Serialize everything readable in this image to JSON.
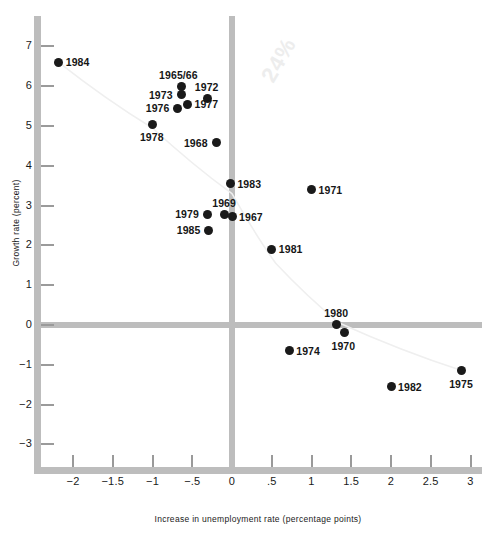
{
  "chart_data": {
    "type": "scatter",
    "title": "",
    "xlabel": "Increase in unemployment rate (percentage points)",
    "ylabel": "Growth rate (percent)",
    "xlim": [
      -2.5,
      3.1
    ],
    "ylim": [
      -3.5,
      7.4
    ],
    "xticks": [
      "−2",
      "−1.5",
      "−1",
      "−.5",
      "0",
      ".5",
      "1",
      "1.5",
      "2",
      "2.5",
      "3"
    ],
    "xtick_values": [
      -2,
      -1.5,
      -1,
      -0.5,
      0,
      0.5,
      1,
      1.5,
      2,
      2.5,
      3
    ],
    "yticks": [
      "7",
      "6",
      "5",
      "4",
      "3",
      "2",
      "1",
      "0",
      "−1",
      "−2",
      "−3"
    ],
    "ytick_values": [
      7,
      6,
      5,
      4,
      3,
      2,
      1,
      0,
      -1,
      -2,
      -3
    ],
    "grid": false,
    "legend": "none",
    "zero_lines": {
      "x": 0,
      "y": 0
    },
    "annotations": [
      {
        "text": "24%",
        "kind": "handwritten-faint",
        "x": 0.35,
        "y": 5.7
      }
    ],
    "trendline": {
      "kind": "faint-curve",
      "description": "faint regression curve from upper-left through cluster to lower-right",
      "points": [
        [
          -2.18,
          6.6
        ],
        [
          -1.0,
          4.95
        ],
        [
          0.0,
          3.3
        ],
        [
          0.55,
          1.55
        ],
        [
          1.35,
          0.05
        ],
        [
          2.9,
          -1.15
        ]
      ]
    },
    "points": [
      {
        "label": "1984",
        "x": -2.18,
        "y": 6.6,
        "label_pos": "right"
      },
      {
        "label": "1965/66",
        "x": -0.64,
        "y": 6.0,
        "label_pos": "top"
      },
      {
        "label": "1973",
        "x": -0.64,
        "y": 5.78,
        "label_pos": "left"
      },
      {
        "label": "1972",
        "x": -0.31,
        "y": 5.7,
        "label_pos": "top"
      },
      {
        "label": "1977",
        "x": -0.56,
        "y": 5.55,
        "label_pos": "right"
      },
      {
        "label": "1976",
        "x": -0.68,
        "y": 5.45,
        "label_pos": "left"
      },
      {
        "label": "1978",
        "x": -1.0,
        "y": 5.05,
        "label_pos": "bottom"
      },
      {
        "label": "1968",
        "x": -0.2,
        "y": 4.58,
        "label_pos": "left"
      },
      {
        "label": "1983",
        "x": -0.02,
        "y": 3.55,
        "label_pos": "right"
      },
      {
        "label": "1971",
        "x": 1.0,
        "y": 3.4,
        "label_pos": "right"
      },
      {
        "label": "1969",
        "x": -0.09,
        "y": 2.78,
        "label_pos": "top"
      },
      {
        "label": "1967",
        "x": 0.0,
        "y": 2.72,
        "label_pos": "right"
      },
      {
        "label": "1979",
        "x": -0.31,
        "y": 2.78,
        "label_pos": "left"
      },
      {
        "label": "1985",
        "x": -0.29,
        "y": 2.38,
        "label_pos": "left"
      },
      {
        "label": "1981",
        "x": 0.5,
        "y": 1.9,
        "label_pos": "right"
      },
      {
        "label": "1980",
        "x": 1.32,
        "y": 0.02,
        "label_pos": "top"
      },
      {
        "label": "1970",
        "x": 1.41,
        "y": -0.2,
        "label_pos": "bottom"
      },
      {
        "label": "1974",
        "x": 0.72,
        "y": -0.65,
        "label_pos": "right"
      },
      {
        "label": "1982",
        "x": 2.0,
        "y": -1.55,
        "label_pos": "right"
      },
      {
        "label": "1975",
        "x": 2.89,
        "y": -1.15,
        "label_pos": "bottom"
      }
    ]
  }
}
